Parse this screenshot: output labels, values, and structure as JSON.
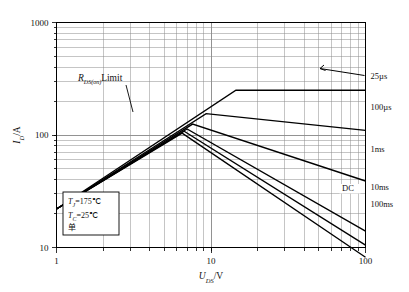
{
  "chart_data": {
    "type": "line",
    "title": "",
    "xlabel": "U_DS/V",
    "ylabel": "I_D/A",
    "xlabel_main": "U",
    "xlabel_sub": "DS",
    "xlabel_unit": "/V",
    "ylabel_main": "I",
    "ylabel_sub": "D",
    "ylabel_unit": "/A",
    "xscale": "log",
    "yscale": "log",
    "xlim": [
      1,
      100
    ],
    "ylim": [
      10,
      1000
    ],
    "xticks": [
      "1",
      "10",
      "100"
    ],
    "yticks": [
      "10",
      "100",
      "1000"
    ],
    "grid": "minor-log-both",
    "legend_position": "right-outside",
    "limit_line": {
      "name": "R_DS(on) Limit",
      "label_main": "R",
      "label_sub": "DS(on)",
      "label_tail": "Limit",
      "points": [
        [
          1,
          22
        ],
        [
          14.5,
          250
        ]
      ]
    },
    "series": [
      {
        "name": "25µs",
        "points": [
          [
            1,
            22
          ],
          [
            14.5,
            250
          ],
          [
            100,
            250
          ]
        ]
      },
      {
        "name": "100µs",
        "points": [
          [
            1,
            22
          ],
          [
            9.3,
            155
          ],
          [
            100,
            110
          ]
        ]
      },
      {
        "name": "1ms",
        "points": [
          [
            1,
            22
          ],
          [
            7.6,
            125
          ],
          [
            100,
            39
          ]
        ]
      },
      {
        "name": "10ms",
        "points": [
          [
            1,
            22
          ],
          [
            7.0,
            113
          ],
          [
            100,
            14
          ]
        ]
      },
      {
        "name": "100ms",
        "points": [
          [
            1,
            22
          ],
          [
            6.7,
            108
          ],
          [
            100,
            10.5
          ]
        ]
      },
      {
        "name": "DC",
        "points": [
          [
            1,
            22
          ],
          [
            6.5,
            104
          ],
          [
            100,
            8.2
          ]
        ]
      }
    ],
    "curve_labels": [
      "25µs",
      "100µs",
      "1ms",
      "10ms",
      "100ms"
    ],
    "inline_labels": [
      "DC"
    ],
    "annotations": [
      {
        "line1_main": "T",
        "line1_sub": "J",
        "line1_val": "=175℃"
      },
      {
        "line2_main": "T",
        "line2_sub": "C",
        "line2_val": "=25℃"
      },
      {
        "line3": "单"
      }
    ],
    "annotation_box": {
      "tj_main": "T",
      "tj_sub": "J",
      "tj_value": "=175℃",
      "tc_main": "T",
      "tc_sub": "C",
      "tc_value": "=25℃",
      "extra": "单"
    },
    "colors": {
      "line": "#000000",
      "grid": "#8c8c8c",
      "axis": "#000000",
      "background": "#ffffff"
    }
  }
}
